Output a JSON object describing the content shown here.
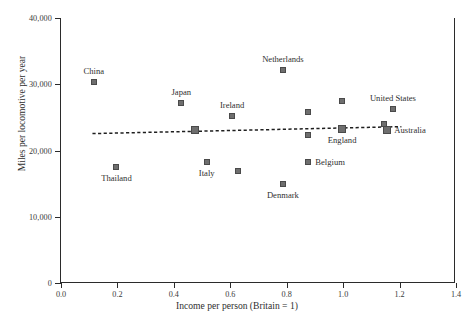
{
  "chart_data": {
    "type": "scatter",
    "title": "",
    "xlabel": "Income per person (Britain = 1)",
    "ylabel": "Miles per locomotive per year",
    "xlim": [
      0.0,
      1.4
    ],
    "ylim": [
      0,
      40000
    ],
    "xticks": [
      "0.0",
      "0.2",
      "0.4",
      "0.6",
      "0.8",
      "1.0",
      "1.2",
      "1.4"
    ],
    "xtick_values": [
      0.0,
      0.2,
      0.4,
      0.6,
      0.8,
      1.0,
      1.2,
      1.4
    ],
    "yticks": [
      "0",
      "10,000",
      "20,000",
      "30,000",
      "40,000"
    ],
    "ytick_values": [
      0,
      10000,
      20000,
      30000,
      40000
    ],
    "grid": false,
    "legend": "none",
    "marker_color": "#6e6e6e",
    "marker_edge_color": "#4a4a4a",
    "axis_color": "#2b2b2b",
    "points": [
      {
        "label": "China",
        "x": 0.12,
        "y": 30400,
        "label_pos": "above",
        "size": "small"
      },
      {
        "label": "Thailand",
        "x": 0.2,
        "y": 17500,
        "label_pos": "below",
        "size": "small"
      },
      {
        "label": "Japan",
        "x": 0.43,
        "y": 27100,
        "label_pos": "above",
        "size": "small"
      },
      {
        "label": "",
        "x": 0.48,
        "y": 23100,
        "label_pos": "none",
        "size": "big"
      },
      {
        "label": "Italy",
        "x": 0.52,
        "y": 18200,
        "label_pos": "below",
        "size": "small"
      },
      {
        "label": "Ireland",
        "x": 0.61,
        "y": 25200,
        "label_pos": "above",
        "size": "small"
      },
      {
        "label": "",
        "x": 0.63,
        "y": 16900,
        "label_pos": "none",
        "size": "small"
      },
      {
        "label": "Denmark",
        "x": 0.79,
        "y": 15000,
        "label_pos": "below",
        "size": "small"
      },
      {
        "label": "Netherlands",
        "x": 0.79,
        "y": 32200,
        "label_pos": "above",
        "size": "small"
      },
      {
        "label": "Belgium",
        "x": 0.88,
        "y": 18300,
        "label_pos": "right",
        "size": "small"
      },
      {
        "label": "",
        "x": 0.88,
        "y": 22300,
        "label_pos": "none",
        "size": "small"
      },
      {
        "label": "",
        "x": 0.88,
        "y": 25800,
        "label_pos": "none",
        "size": "small"
      },
      {
        "label": "England",
        "x": 1.0,
        "y": 23200,
        "label_pos": "below",
        "size": "big"
      },
      {
        "label": "",
        "x": 1.0,
        "y": 27400,
        "label_pos": "none",
        "size": "small"
      },
      {
        "label": "",
        "x": 1.15,
        "y": 24000,
        "label_pos": "none",
        "size": "small"
      },
      {
        "label": "United States",
        "x": 1.18,
        "y": 26300,
        "label_pos": "above",
        "size": "small"
      },
      {
        "label": "Australia",
        "x": 1.16,
        "y": 23100,
        "label_pos": "right",
        "size": "big"
      }
    ],
    "trendline": {
      "style": "dotted",
      "color": "#1f1f1f",
      "x_start": 0.115,
      "y_start": 22550,
      "x_end": 1.21,
      "y_end": 23600
    }
  }
}
